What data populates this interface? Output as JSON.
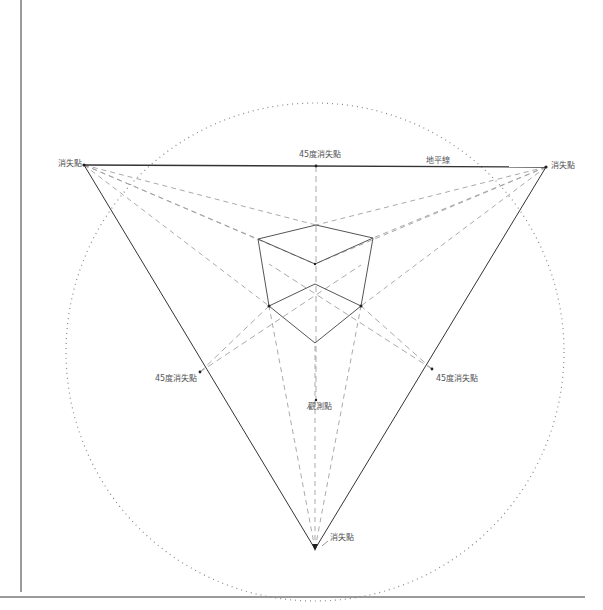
{
  "diagram": {
    "labels": {
      "vp_left": "消失點",
      "vp_right": "消失點",
      "vp_bottom": "消失點",
      "vp45_top": "45度消失點",
      "vp45_left": "45度消失點",
      "vp45_right": "45度消失點",
      "horizon": "地平線",
      "observer": "觀測點"
    },
    "colors": {
      "frame": "#9a9a9a",
      "solid": "#333333",
      "dashed": "#9a9a9a",
      "dotted_circle": "#888888",
      "text": "#555555"
    },
    "points": {
      "vp_left": [
        84,
        165
      ],
      "vp_right": [
        546,
        167
      ],
      "vp_bottom": [
        315,
        549
      ],
      "vp45_top": [
        316,
        166
      ],
      "vp45_left": [
        200,
        372
      ],
      "vp45_right": [
        432,
        369
      ],
      "observer": [
        315,
        400
      ],
      "circle_center": [
        315,
        352
      ],
      "circle_radius": 248
    },
    "cube": {
      "top": [
        316,
        225
      ],
      "left_top": [
        258,
        239
      ],
      "right_top": [
        373,
        238
      ],
      "center_top": [
        315,
        264
      ],
      "center_inner": [
        315,
        284
      ],
      "left_bottom": [
        269,
        306
      ],
      "right_bottom": [
        361,
        306
      ],
      "bottom": [
        315,
        343
      ]
    }
  }
}
